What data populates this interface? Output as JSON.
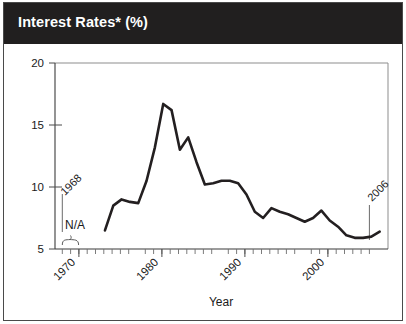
{
  "figure": {
    "title": "Interest Rates* (%)",
    "title_bar_color": "#211f1f",
    "title_text_color": "#ffffff",
    "line_color": "#231f20",
    "background": "#ffffff",
    "border_color": "#4a4a4a"
  },
  "annotations": {
    "start_year_label": "1968",
    "end_year_label": "2006",
    "na_label": "N/A"
  },
  "chart_data": {
    "type": "line",
    "title": "Interest Rates* (%)",
    "xlabel": "Year",
    "ylabel": "",
    "xlim": [
      1967,
      2007
    ],
    "ylim": [
      5,
      20
    ],
    "ytick_labels": [
      "5",
      "10",
      "15",
      "20"
    ],
    "ytick_values": [
      5,
      10,
      15,
      20
    ],
    "xtick_labels": [
      "1970",
      "1980",
      "1990",
      "2000"
    ],
    "xtick_values": [
      1970,
      1980,
      1990,
      2000
    ],
    "minor_tick_interval": 1,
    "grid": false,
    "legend": null,
    "note": "Data not available (N/A) for 1968-1972; series begins 1973 and ends 2006",
    "na_range": [
      1968,
      1972
    ],
    "x": [
      1973,
      1974,
      1975,
      1976,
      1977,
      1978,
      1979,
      1980,
      1981,
      1982,
      1983,
      1984,
      1985,
      1986,
      1987,
      1988,
      1989,
      1990,
      1991,
      1992,
      1993,
      1994,
      1995,
      1996,
      1997,
      1998,
      1999,
      2000,
      2001,
      2002,
      2003,
      2004,
      2005,
      2006
    ],
    "values": [
      6.5,
      8.5,
      9.0,
      8.8,
      8.7,
      10.5,
      13.2,
      16.7,
      16.2,
      13.0,
      14.0,
      12.0,
      10.2,
      10.3,
      10.5,
      10.5,
      10.3,
      9.4,
      8.0,
      7.5,
      8.3,
      8.0,
      7.8,
      7.5,
      7.2,
      7.5,
      8.1,
      7.3,
      6.8,
      6.1,
      5.9,
      5.9,
      6.0,
      6.4
    ]
  }
}
